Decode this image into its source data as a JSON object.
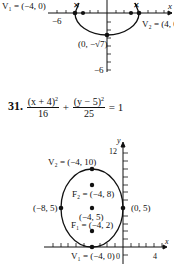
{
  "graph_top": {
    "labels": {
      "v1": "V₁ = (−4, 0)",
      "v2": "V₂ = (4, 0",
      "neg6_x": "−6",
      "bottom_point": "(0, −√7)",
      "neg6_y": "−6",
      "x_axis": "x"
    }
  },
  "problem": {
    "number": "31.",
    "frac1_num": "(x + 4)",
    "frac1_exp": "2",
    "frac1_den": "16",
    "plus": "+",
    "frac2_num": "(y − 5)",
    "frac2_exp": "2",
    "frac2_den": "25",
    "equals": "= 1"
  },
  "graph_bottom": {
    "labels": {
      "y_axis": "y",
      "x_axis": "x",
      "tick_12": "12",
      "v2": "V₂ = (−4, 10)",
      "f2": "F₂ = (−4, 8)",
      "left": "(−8, 5)",
      "right": "(0, 5)",
      "center": "(−4, 5)",
      "f1": "F₁ = (−4, 2)",
      "v1": "V₁ = (−4, 0)",
      "origin": "0",
      "tick_4": "4"
    }
  }
}
